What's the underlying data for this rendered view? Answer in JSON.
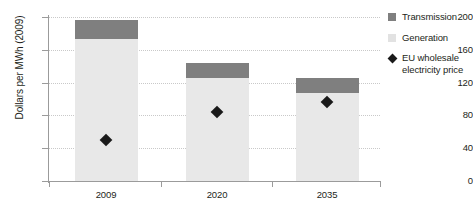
{
  "chart_data": {
    "type": "bar",
    "stacked": true,
    "title": "",
    "xlabel": "",
    "ylabel": "Dollars per MWh (2009)",
    "categories": [
      "2009",
      "2020",
      "2035"
    ],
    "ylim": [
      0,
      200
    ],
    "yticks": [
      0,
      40,
      80,
      120,
      160,
      200
    ],
    "grid": true,
    "legend_position": "right",
    "series": [
      {
        "name": "Generation",
        "color": "#e8e8e8",
        "values": [
          173,
          126,
          107
        ]
      },
      {
        "name": "Transmission",
        "color": "#7f7f7f",
        "values": [
          23,
          18,
          19
        ]
      },
      {
        "name": "EU wholesale electricity price",
        "type": "scatter",
        "marker": "diamond",
        "color": "#1a1a1a",
        "values": [
          56,
          90,
          102
        ]
      }
    ],
    "totals": [
      196,
      144,
      126
    ]
  },
  "axes": {
    "y_title": "Dollars per MWh (2009)",
    "y_tick_labels": [
      "200",
      "160",
      "120",
      "80",
      "40",
      "0"
    ],
    "x_tick_labels": [
      "2009",
      "2020",
      "2035"
    ]
  },
  "legend": {
    "items": [
      {
        "label": "Transmission",
        "swatch": "square-dark"
      },
      {
        "label": "Generation",
        "swatch": "square-light"
      },
      {
        "label": "EU wholesale electricity price",
        "swatch": "diamond-marker"
      }
    ]
  }
}
